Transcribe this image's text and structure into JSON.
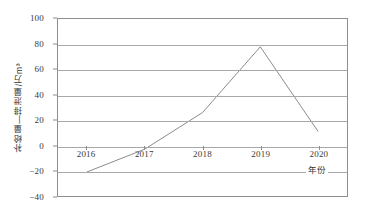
{
  "chart_data": {
    "type": "line",
    "title": "",
    "subtitle": "",
    "xlabel": "年份",
    "ylabel": "补给量—排泄量/万m³",
    "categories": [
      "2016",
      "2017",
      "2018",
      "2019",
      "2020"
    ],
    "values": [
      -21,
      -3,
      26,
      78,
      11
    ],
    "series": [
      {
        "name": "补给量—排泄量",
        "values": [
          -21,
          -3,
          26,
          78,
          11
        ]
      }
    ],
    "ylim": [
      -40,
      100
    ],
    "xlim_categories": [
      "2016",
      "2020"
    ],
    "y_ticks": [
      100,
      80,
      60,
      40,
      20,
      0,
      -20,
      -40
    ],
    "y_ticklabels": [
      "100",
      "80",
      "60",
      "40",
      "20",
      "0",
      "−20",
      "−40"
    ],
    "x_ticklabels": [
      "2016",
      "2017",
      "2018",
      "2019",
      "2020"
    ],
    "grid": true,
    "grid_axis": "y",
    "legend": false,
    "legend_position": "none",
    "markers": false,
    "colors": {
      "line": "#8a8a8a",
      "grid": "#a8a8a8",
      "frame": "#8e8e8e",
      "text": "#3a3a3a",
      "background": "#ffffff"
    }
  }
}
